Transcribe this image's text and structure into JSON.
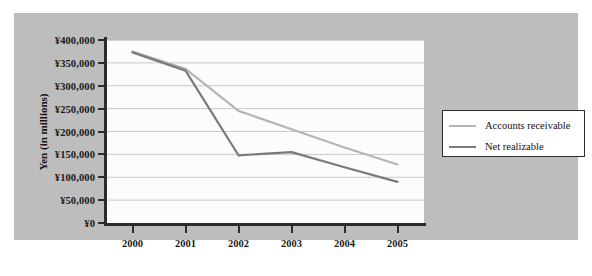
{
  "chart_data": {
    "type": "line",
    "title": "",
    "xlabel": "",
    "ylabel": "Yen (in millions)",
    "categories": [
      "2000",
      "2001",
      "2002",
      "2003",
      "2004",
      "2005"
    ],
    "x": [
      2000,
      2001,
      2002,
      2003,
      2004,
      2005
    ],
    "ylim": [
      0,
      400000
    ],
    "ytick_values": [
      400000,
      350000,
      300000,
      250000,
      200000,
      150000,
      100000,
      50000,
      0
    ],
    "ytick_labels": [
      "¥400,000",
      "¥350,000",
      "¥300,000",
      "¥250,000",
      "¥200,000",
      "¥150,000",
      "¥100,000",
      "¥50,000",
      "¥0"
    ],
    "grid": true,
    "grid_axis": "y",
    "legend_position": "right",
    "series": [
      {
        "name": "Accounts receivable",
        "color": "#b5b5b5",
        "values": [
          375000,
          337000,
          245000,
          205000,
          165000,
          128000
        ]
      },
      {
        "name": "Net realizable",
        "color": "#7a7a7a",
        "values": [
          373000,
          333000,
          148000,
          155000,
          122000,
          90000
        ]
      }
    ]
  },
  "colors": {
    "panel_background": "#bdbdbd",
    "plot_background": "#fcfcfc",
    "gridline": "#c9c9c9",
    "axis": "#2b2b2b",
    "text": "#141414",
    "legend_background": "#ffffff",
    "legend_border": "#2e2e2e"
  }
}
